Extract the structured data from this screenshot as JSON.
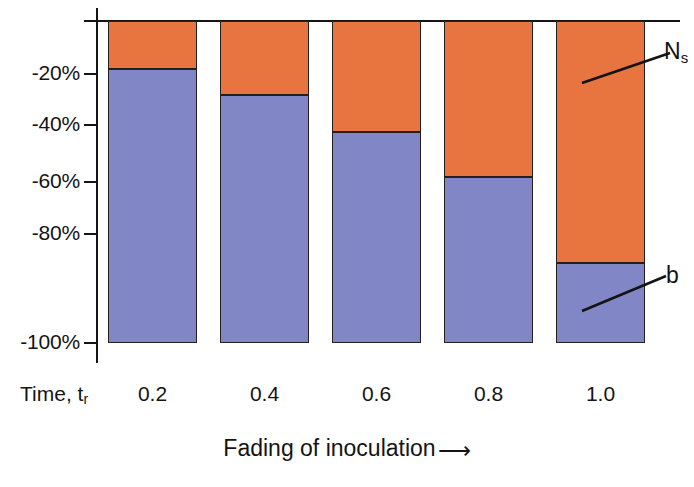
{
  "chart_data": {
    "type": "bar",
    "title": "",
    "subtitle": "",
    "stacked": true,
    "orientation": "vertical",
    "xlabel": "Fading of inoculation",
    "xlabel_arrow": "⟶",
    "x_axis_name": "Time, t",
    "x_axis_name_subscript": "r",
    "ylabel": "",
    "categories": [
      "0.2",
      "0.4",
      "0.6",
      "0.8",
      "1.0"
    ],
    "ylim": [
      -100,
      0
    ],
    "ytick_labels": [
      "-20%",
      "-40%",
      "-60%",
      "-80%",
      "-100%"
    ],
    "ytick_values": [
      -20,
      -40,
      -60,
      -80,
      -100
    ],
    "grid": false,
    "legend_position": "callout-right",
    "series": [
      {
        "name": "Ns",
        "label": "N",
        "label_subscript": "s",
        "color": "#e8743f",
        "values": [
          -15,
          -23,
          -34.5,
          -48.5,
          -75
        ],
        "description": "upper orange segment measured from 0% down to the listed value"
      },
      {
        "name": "b",
        "label": "b",
        "label_subscript": "",
        "color": "#8187c6",
        "values": [
          -85,
          -77,
          -65.5,
          -51.5,
          -25
        ],
        "description": "lower blue segment, remainder down to -100%"
      }
    ],
    "segment_boundaries_pct": [
      -15,
      -23,
      -34.5,
      -48.5,
      -75
    ],
    "bar_outline_color": "#24201e",
    "axis_color": "#151515",
    "background_color": "#ffffff"
  },
  "annotations": {
    "ns_callout": {
      "label": "N",
      "subscript": "s"
    },
    "b_callout": {
      "label": "b",
      "subscript": ""
    }
  }
}
